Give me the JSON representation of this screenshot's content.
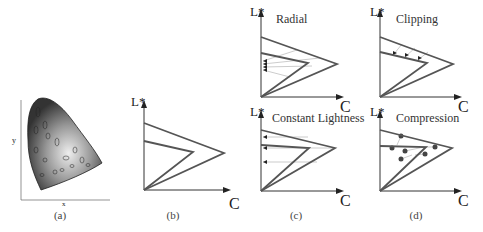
{
  "panels": {
    "a": {
      "caption": "(a)",
      "xlabel": "x",
      "ylabel": "y",
      "xticks": [
        "0.0",
        "0.1",
        "0.2",
        "0.3",
        "0.4",
        "0.5",
        "0.6",
        "0.7"
      ],
      "yticks": [
        "0.0",
        "0.1",
        "0.2",
        "0.3",
        "0.4",
        "0.5",
        "0.6",
        "0.7",
        "0.8"
      ]
    },
    "b": {
      "caption": "(b)",
      "ylabel": "L*",
      "xlabel": "C"
    },
    "c_top": {
      "title": "Radial",
      "ylabel": "L*",
      "xlabel": "C"
    },
    "c_bottom": {
      "title": "Constant Lightness",
      "ylabel": "L*",
      "xlabel": "C"
    },
    "c": {
      "caption": "(c)"
    },
    "d_top": {
      "title": "Clipping",
      "ylabel": "L*",
      "xlabel": "C"
    },
    "d_bottom": {
      "title": "Compression",
      "ylabel": "L*",
      "xlabel": "C"
    },
    "d": {
      "caption": "(d)"
    }
  },
  "colors": {
    "gamut_outline": "#555555",
    "axis": "#333333",
    "mapping_lines": "#aaaaaa",
    "points": "#444444"
  }
}
